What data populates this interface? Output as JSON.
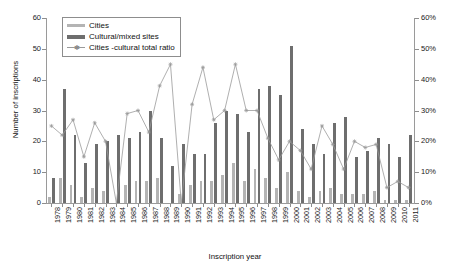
{
  "chart_data": {
    "type": "bar",
    "title": "",
    "subtitle": "",
    "xlabel": "Inscription year",
    "ylabel": "Number of inscriptions",
    "y2label": "Percentage of cities",
    "ylim": [
      0,
      60
    ],
    "y2lim": [
      0,
      60
    ],
    "yticks": [
      "0",
      "10",
      "20",
      "30",
      "40",
      "50",
      "60"
    ],
    "y2ticks": [
      "0%",
      "10%",
      "20%",
      "30%",
      "40%",
      "50%",
      "60%"
    ],
    "grid": false,
    "legend_position": "top-left",
    "categories": [
      "1978",
      "1979",
      "1980",
      "1981",
      "1982",
      "1983",
      "1984",
      "1985",
      "1986",
      "1987",
      "1988",
      "1989",
      "1990",
      "1991",
      "1992",
      "1993",
      "1994",
      "1995",
      "1996",
      "1997",
      "1998",
      "1999",
      "2000",
      "2001",
      "2002",
      "2003",
      "2004",
      "2005",
      "2006",
      "2007",
      "2008",
      "2009",
      "2010",
      "2011"
    ],
    "series": [
      {
        "name": "Cities",
        "type": "bar",
        "color": "#b4b4b4",
        "values": [
          2,
          8,
          6,
          2,
          5,
          4,
          0,
          6,
          7,
          7,
          8,
          0,
          3,
          6,
          7,
          7,
          9,
          13,
          7,
          11,
          8,
          5,
          10,
          4,
          2,
          4,
          5,
          3,
          3,
          3,
          4,
          1,
          1,
          1
        ]
      },
      {
        "name": "Cultural/mixed sites",
        "type": "bar",
        "color": "#6e6e6e",
        "values": [
          8,
          37,
          22,
          13,
          19,
          20,
          22,
          21,
          23,
          30,
          21,
          12,
          19,
          16,
          16,
          26,
          30,
          29,
          23,
          37,
          38,
          35,
          51,
          24,
          19,
          16,
          26,
          28,
          15,
          17,
          21,
          19,
          15,
          22
        ]
      },
      {
        "name": "Cities -cultural total ratio",
        "type": "line",
        "color": "#9a9a9a",
        "axis": "right",
        "values": [
          25,
          22,
          27,
          15,
          26,
          20,
          0,
          29,
          30,
          23,
          38,
          45,
          0,
          32,
          44,
          27,
          30,
          45,
          30,
          30,
          21,
          14,
          20,
          17,
          11,
          25,
          19,
          11,
          20,
          18,
          19,
          5,
          7,
          5
        ]
      }
    ]
  },
  "legend": {
    "items": [
      {
        "label": "Cities",
        "key": "bar-swatch-light"
      },
      {
        "label": "Cultural/mixed sites",
        "key": "bar-swatch-dark"
      },
      {
        "label": "Cities -cultural total ratio",
        "key": "line-swatch-marker"
      }
    ]
  },
  "colors": {
    "cities": "#b4b4b4",
    "cultural": "#6e6e6e",
    "ratio_line": "#9a9a9a",
    "axis": "#9a9a9a",
    "text": "#111111",
    "background": "#ffffff"
  }
}
